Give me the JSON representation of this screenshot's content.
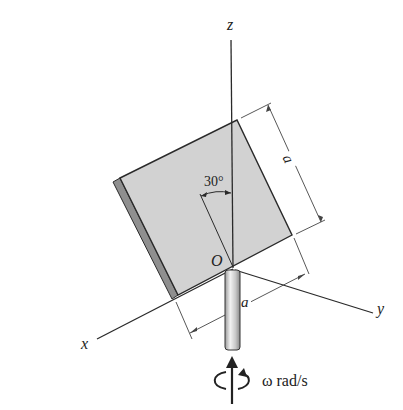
{
  "diagram": {
    "type": "3d-rigid-body-rotation",
    "axes": {
      "z_label": "z",
      "x_label": "x",
      "y_label": "y",
      "origin_label": "O"
    },
    "plate": {
      "shape": "square plate",
      "tilt_angle_label": "30°",
      "side_label_1": "a",
      "side_label_2": "a"
    },
    "rotation": {
      "label": "ω rad/s"
    },
    "colors": {
      "plate_face": "#d2d2d2",
      "plate_edge": "#8f8f8f",
      "line": "#2a2a2a",
      "background": "#ffffff"
    }
  }
}
